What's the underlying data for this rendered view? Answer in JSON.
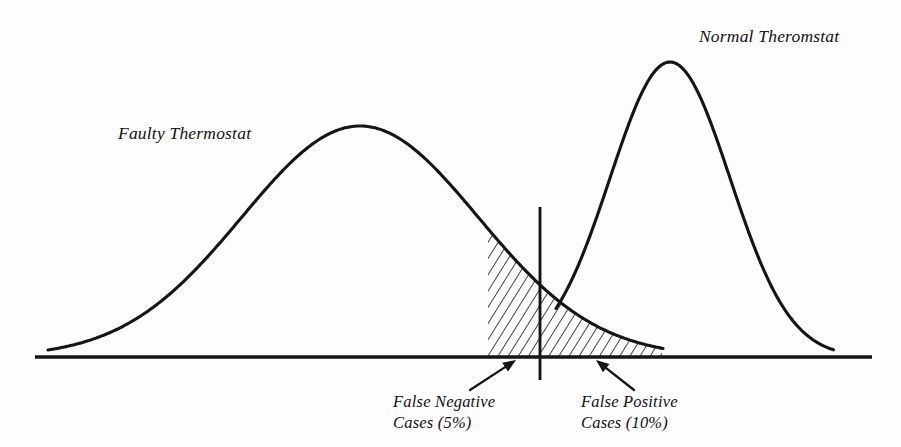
{
  "figure": {
    "width": 901,
    "height": 447,
    "background_color": "#fdfdfd",
    "ink_color": "#151515"
  },
  "labels": {
    "faulty_curve": "Faulty Thermostat",
    "normal_curve": "Normal Theromstat",
    "false_negative_line1": "False Negative",
    "false_negative_line2": "Cases (5%)",
    "false_positive_line1": "False Positive",
    "false_positive_line2": "Cases (10%)"
  },
  "chart_data": {
    "type": "line",
    "title": "",
    "xlabel": "",
    "ylabel": "",
    "grid": false,
    "legend_position": "inline-annotation",
    "axis": {
      "baseline_y": 357,
      "baseline_x_start": 35,
      "baseline_x_end": 872,
      "x_tick_labels": [],
      "y_tick_labels": []
    },
    "series": [
      {
        "name": "Faulty Thermostat",
        "shape": "gaussian",
        "peak_x": 360,
        "peak_y": 126,
        "amplitude": 231,
        "sigma": 118,
        "x_start": 48,
        "x_end": 664,
        "label_position": {
          "x": 118,
          "y": 123
        }
      },
      {
        "name": "Normal Theromstat",
        "shape": "gaussian",
        "peak_x": 670,
        "peak_y": 62,
        "amplitude": 295,
        "sigma": 60,
        "x_start": 556,
        "x_end": 834,
        "label_position": {
          "x": 699,
          "y": 26
        }
      }
    ],
    "threshold": {
      "name": "decision-threshold",
      "x": 540,
      "y_top": 207,
      "y_bottom": 380
    },
    "shaded_regions": [
      {
        "name": "overlap-error-region",
        "pattern": "diagonal-hatch",
        "hatch_angle_deg": 32,
        "hatch_spacing_px": 6,
        "x_start": 488,
        "x_end": 662,
        "bounded_above_by": "Faulty Thermostat"
      }
    ],
    "annotations": [
      {
        "name": "false-negative",
        "text": "False Negative Cases (5%)",
        "value_percent": 5,
        "side": "left-of-threshold",
        "label_x": 393,
        "label_y": 391,
        "arrow_from": [
          470,
          390
        ],
        "arrow_to": [
          516,
          360
        ]
      },
      {
        "name": "false-positive",
        "text": "False Positive Cases (10%)",
        "value_percent": 10,
        "side": "right-of-threshold",
        "label_x": 581,
        "label_y": 391,
        "arrow_from": [
          634,
          390
        ],
        "arrow_to": [
          596,
          360
        ]
      }
    ]
  }
}
